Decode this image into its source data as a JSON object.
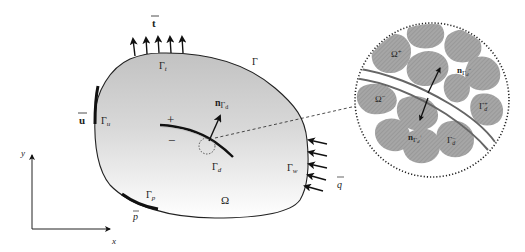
{
  "diagram": {
    "type": "continuum body with crack and boundary conditions",
    "labels": {
      "traction": "t",
      "boundary": "Γ",
      "traction_boundary": "Γ",
      "traction_boundary_sub": "t",
      "displacement": "u",
      "displacement_boundary": "Γ",
      "displacement_boundary_sub": "u",
      "plus": "+",
      "minus": "−",
      "crack_normal": "n",
      "crack_normal_sub": "Γ",
      "crack_normal_subsub": "d",
      "crack_boundary": "Γ",
      "crack_boundary_sub": "d",
      "domain": "Ω",
      "pressure_boundary": "Γ",
      "pressure_boundary_sub": "p",
      "pressure": "p",
      "flux_boundary": "Γ",
      "flux_boundary_sub": "w",
      "flux": "q",
      "axis_x": "x",
      "axis_y": "y"
    },
    "detail": {
      "omega_plus": "Ω",
      "omega_plus_sup": "+",
      "omega_minus": "Ω",
      "omega_minus_sup": "−",
      "normal_minus": "n",
      "normal_minus_sub": "Γ",
      "normal_minus_subsub": "d",
      "normal_minus_sup": "−",
      "normal_plus": "n",
      "normal_plus_sub": "Γ",
      "normal_plus_subsub": "d",
      "normal_plus_sup": "+",
      "gamma_plus": "Γ",
      "gamma_plus_sub": "d",
      "gamma_plus_sup": "+",
      "gamma_minus": "Γ",
      "gamma_minus_sub": "d",
      "gamma_minus_sup": "−"
    },
    "colors": {
      "body_top": "#c4c4c4",
      "body_bottom": "#ffffff",
      "outline": "#222222",
      "grain": "#9a9a9a",
      "crack_band": "#6e6e6e"
    }
  }
}
